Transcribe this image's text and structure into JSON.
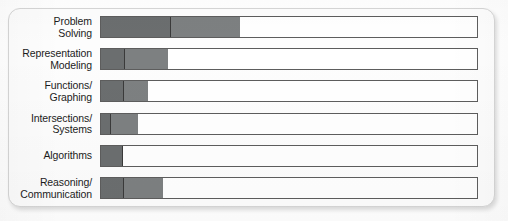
{
  "chart_data": {
    "type": "bar",
    "orientation": "horizontal",
    "stacked": true,
    "title": "",
    "subtitle": "",
    "xlabel": "",
    "ylabel": "",
    "grid": false,
    "legend_position": "none",
    "axis_visible": false,
    "xlim": [
      0,
      100
    ],
    "categories": [
      "Problem\nSolving",
      "Representation\nModeling",
      "Functions/\nGraphing",
      "Intersections/\nSystems",
      "Algorithms",
      "Reasoning/\nCommunication"
    ],
    "series": [
      {
        "name": "Segment A",
        "color": "#6b6e6f",
        "values": [
          18.5,
          6.3,
          6.1,
          2.6,
          5.8,
          6.1
        ]
      },
      {
        "name": "Segment B",
        "color": "#7d8081",
        "values": [
          18.3,
          11.4,
          6.3,
          7.1,
          0,
          10.3
        ]
      }
    ],
    "totals": [
      36.8,
      17.7,
      12.4,
      9.7,
      5.8,
      16.4
    ],
    "track_color": "#ffffff",
    "track_border_color": "#5d5d5d"
  },
  "card": {
    "background": "#fdfdfd",
    "border_color": "#d6d6d6"
  }
}
